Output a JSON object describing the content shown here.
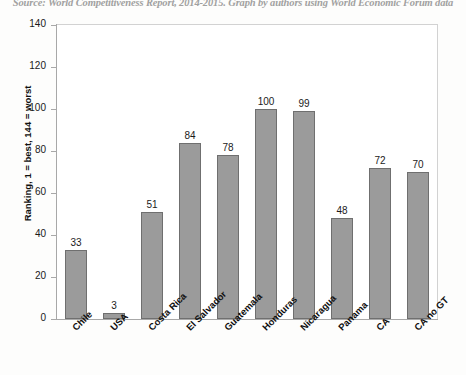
{
  "caption": {
    "text": "Source: World Competitiveness Report, 2014-2015. Graph by authors using World Economic Forum data"
  },
  "chart_data": {
    "type": "bar",
    "title": "",
    "subtitle": "",
    "xlabel": "",
    "ylabel": "Ranking, 1 = best, 144 = worst",
    "ylim": [
      0,
      140
    ],
    "ytick_step": 20,
    "yticks": [
      0,
      20,
      40,
      60,
      80,
      100,
      120,
      140
    ],
    "ytick_labels": [
      "0",
      "20",
      "40",
      "60",
      "80",
      "100",
      "120",
      "140"
    ],
    "grid": false,
    "legend": "none",
    "bar_color": "#9b9b9b",
    "bar_border_color": "#6f6f6f",
    "show_data_labels": true,
    "categories": [
      "Chile",
      "USA",
      "Costa Rica",
      "El Salvador",
      "Guatemala",
      "Honduras",
      "Nicaragua",
      "Panama",
      "CA",
      "CA no GT"
    ],
    "values": [
      33,
      3,
      51,
      84,
      78,
      100,
      99,
      48,
      72,
      70
    ],
    "value_labels": [
      "33",
      "3",
      "51",
      "84",
      "78",
      "100",
      "99",
      "48",
      "72",
      "70"
    ]
  }
}
